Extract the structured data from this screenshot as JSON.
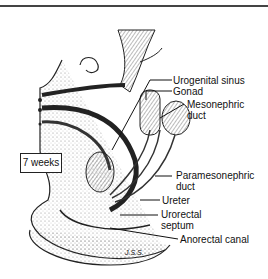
{
  "figure": {
    "stage_label": "7 weeks",
    "labels": [
      {
        "id": "urogenital-sinus",
        "text": "Urogenital sinus"
      },
      {
        "id": "gonad",
        "text": "Gonad"
      },
      {
        "id": "mesonephric-duct-1",
        "text": "Mesonephric"
      },
      {
        "id": "mesonephric-duct-2",
        "text": "duct"
      },
      {
        "id": "paramesonephric-duct-1",
        "text": "Paramesonephric"
      },
      {
        "id": "paramesonephric-duct-2",
        "text": "duct"
      },
      {
        "id": "ureter",
        "text": "Ureter"
      },
      {
        "id": "urorectal-septum-1",
        "text": "Urorectal"
      },
      {
        "id": "urorectal-septum-2",
        "text": "septum"
      },
      {
        "id": "anorectal-canal",
        "text": "Anorectal canal"
      }
    ],
    "signature": "J.S.S."
  }
}
